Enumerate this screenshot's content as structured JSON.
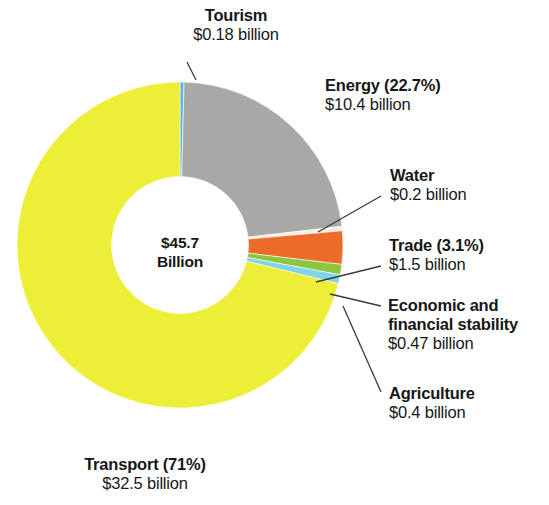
{
  "chart_data": {
    "type": "pie",
    "title": "",
    "subtitle": "",
    "center_label_line1": "$45.7",
    "center_label_line2": "Billion",
    "total": 45.7,
    "total_units": "billion",
    "units": "$ billion",
    "legend": "none",
    "grid": false,
    "donut_hole_ratio": 0.42,
    "categories": [
      "Transport",
      "Tourism",
      "Energy",
      "Water",
      "Trade",
      "Economic and financial stability",
      "Agriculture"
    ],
    "values": [
      32.5,
      0.18,
      10.4,
      0.2,
      1.5,
      0.47,
      0.4
    ],
    "percents": [
      71,
      0.4,
      22.7,
      0.44,
      3.1,
      1.03,
      0.88
    ],
    "colors": [
      "#ecee38",
      "#5ab6de",
      "#a8a8a6",
      "#f2f0e4",
      "#ec6b2a",
      "#8cc63f",
      "#7fd4e8"
    ],
    "slices": [
      {
        "name": "Transport",
        "value": 32.5,
        "percent_label": "71%",
        "title_text": "Transport (71%)",
        "value_text": "$32.5 billion",
        "color": "#ecee38"
      },
      {
        "name": "Tourism",
        "value": 0.18,
        "percent_label": "",
        "title_text": "Tourism",
        "value_text": "$0.18 billion",
        "color": "#5ab6de"
      },
      {
        "name": "Energy",
        "value": 10.4,
        "percent_label": "22.7%",
        "title_text": "Energy (22.7%)",
        "value_text": "$10.4 billion",
        "color": "#a8a8a6"
      },
      {
        "name": "Water",
        "value": 0.2,
        "percent_label": "",
        "title_text": "Water",
        "value_text": "$0.2 billion",
        "color": "#f2f0e4"
      },
      {
        "name": "Trade",
        "value": 1.5,
        "percent_label": "3.1%",
        "title_text": "Trade (3.1%)",
        "value_text": "$1.5 billion",
        "color": "#ec6b2a"
      },
      {
        "name": "Economic and financial stability",
        "value": 0.47,
        "percent_label": "",
        "title_text_line1": "Economic and",
        "title_text_line2": "financial stability",
        "value_text": "$0.47 billion",
        "color": "#8cc63f"
      },
      {
        "name": "Agriculture",
        "value": 0.4,
        "percent_label": "",
        "title_text": "Agriculture",
        "value_text": "$0.4 billion",
        "color": "#7fd4e8"
      }
    ]
  },
  "labels": {
    "tourism": {
      "title": "Tourism",
      "value": "$0.18 billion"
    },
    "energy": {
      "title": "Energy (22.7%)",
      "value": "$10.4 billion"
    },
    "water": {
      "title": "Water",
      "value": "$0.2 billion"
    },
    "trade": {
      "title": "Trade (3.1%)",
      "value": "$1.5 billion"
    },
    "economic": {
      "title_line1": "Economic and",
      "title_line2": "financial stability",
      "value": "$0.47 billion"
    },
    "agriculture": {
      "title": "Agriculture",
      "value": "$0.4 billion"
    },
    "transport": {
      "title": "Transport (71%)",
      "value": "$32.5 billion"
    },
    "center": {
      "line1": "$45.7",
      "line2": "Billion"
    }
  }
}
